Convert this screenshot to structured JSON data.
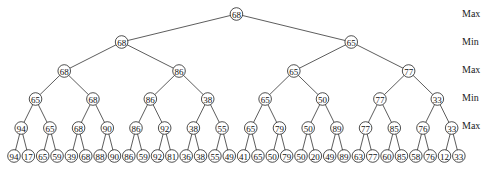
{
  "diagram": {
    "type": "minimax-game-tree",
    "level_labels": [
      "Max",
      "Min",
      "Max",
      "Min",
      "Max"
    ],
    "levels": [
      [
        68
      ],
      [
        68,
        65
      ],
      [
        68,
        86,
        65,
        77
      ],
      [
        65,
        68,
        86,
        38,
        65,
        50,
        77,
        33
      ],
      [
        94,
        65,
        68,
        90,
        86,
        92,
        38,
        55,
        65,
        79,
        50,
        89,
        77,
        85,
        76,
        33
      ],
      [
        94,
        17,
        65,
        59,
        39,
        68,
        88,
        90,
        86,
        59,
        92,
        81,
        36,
        38,
        55,
        49,
        41,
        65,
        50,
        79,
        50,
        20,
        49,
        89,
        63,
        77,
        60,
        85,
        58,
        76,
        12,
        33
      ]
    ]
  }
}
